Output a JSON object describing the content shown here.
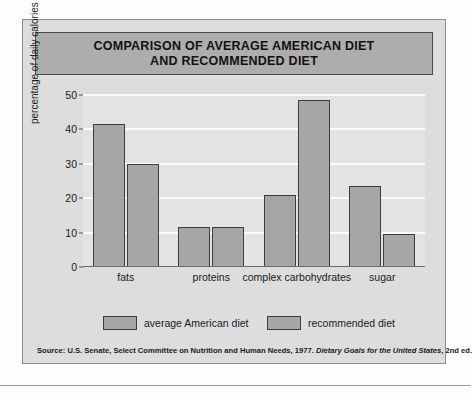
{
  "chart_data": {
    "type": "bar",
    "title": "COMPARISON OF AVERAGE AMERICAN DIET AND RECOMMENDED DIET",
    "title_lines": [
      "COMPARISON OF AVERAGE AMERICAN DIET",
      "AND RECOMMENDED DIET"
    ],
    "categories": [
      "fats",
      "proteins",
      "complex carbohydrates",
      "sugar"
    ],
    "series": [
      {
        "name": "average American diet",
        "values": [
          41.5,
          11.5,
          21.0,
          23.5
        ],
        "color": "#a6a6a6"
      },
      {
        "name": "recommended diet",
        "values": [
          30.0,
          11.5,
          48.5,
          9.5
        ],
        "color": "#a6a6a6"
      }
    ],
    "xlabel": "",
    "ylabel": "percentage of daily calories",
    "ylim": [
      0,
      50
    ],
    "yticks": [
      0,
      10,
      20,
      30,
      40,
      50
    ],
    "ytick_labels": [
      "0",
      "10",
      "20",
      "30",
      "40",
      "50"
    ],
    "grid": true,
    "grid_axis": "y",
    "legend_position": "bottom"
  },
  "source": {
    "prefix": "Source: U.S. Senate, Select Committee on Nutrition and Human Needs, 1977. ",
    "italic": "Dietary Goals for the United States",
    "suffix": ", 2nd ed."
  },
  "colors": {
    "panel_background": "#dddddd",
    "plot_background": "#e3e3e3",
    "title_banner": "#adadad",
    "bar_fill": "#a6a6a6",
    "bar_stroke": "#3d3d3d",
    "gridline": "#fbfbfb",
    "text": "#1a1a1a"
  }
}
